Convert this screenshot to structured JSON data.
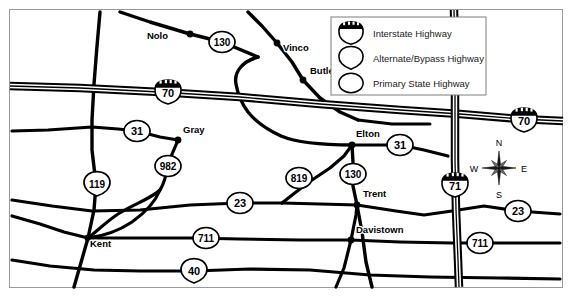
{
  "map": {
    "border_color": "#9a9a9a",
    "road_color": "#000000",
    "background": "#ffffff",
    "cities": [
      {
        "name": "Nolo",
        "label_x": 168,
        "label_y": 39,
        "dot_x": 190,
        "dot_y": 34,
        "anchor": "end"
      },
      {
        "name": "Vinco",
        "label_x": 283,
        "label_y": 51,
        "dot_x": 277,
        "dot_y": 43,
        "anchor": "start"
      },
      {
        "name": "Butler",
        "label_x": 310,
        "label_y": 74,
        "dot_x": 303,
        "dot_y": 80,
        "anchor": "start"
      },
      {
        "name": "Gray",
        "label_x": 183,
        "label_y": 133,
        "dot_x": 178,
        "dot_y": 140,
        "anchor": "start"
      },
      {
        "name": "Elton",
        "label_x": 356,
        "label_y": 137,
        "dot_x": 352,
        "dot_y": 145,
        "anchor": "start"
      },
      {
        "name": "Trent",
        "label_x": 363,
        "label_y": 197,
        "dot_x": 357,
        "dot_y": 205,
        "anchor": "start"
      },
      {
        "name": "Kent",
        "label_x": 90,
        "label_y": 247,
        "dot_x": 88,
        "dot_y": 238,
        "anchor": "start"
      },
      {
        "name": "Davistown",
        "label_x": 356,
        "label_y": 233,
        "dot_x": 351,
        "dot_y": 240,
        "anchor": "start"
      }
    ],
    "shields": [
      {
        "route": "130",
        "type": "primary-state",
        "x": 222,
        "y": 42
      },
      {
        "route": "70",
        "type": "interstate",
        "x": 168,
        "y": 92
      },
      {
        "route": "70",
        "type": "interstate",
        "x": 524,
        "y": 120
      },
      {
        "route": "31",
        "type": "primary-state",
        "x": 137,
        "y": 131
      },
      {
        "route": "31",
        "type": "primary-state",
        "x": 400,
        "y": 145
      },
      {
        "route": "982",
        "type": "primary-state",
        "x": 168,
        "y": 166
      },
      {
        "route": "119",
        "type": "alternate-bypass",
        "x": 97,
        "y": 184
      },
      {
        "route": "819",
        "type": "primary-state",
        "x": 299,
        "y": 178
      },
      {
        "route": "130",
        "type": "primary-state",
        "x": 353,
        "y": 174
      },
      {
        "route": "71",
        "type": "interstate",
        "x": 455,
        "y": 185
      },
      {
        "route": "23",
        "type": "primary-state",
        "x": 240,
        "y": 203
      },
      {
        "route": "23",
        "type": "primary-state",
        "x": 518,
        "y": 211
      },
      {
        "route": "711",
        "type": "primary-state",
        "x": 206,
        "y": 238
      },
      {
        "route": "711",
        "type": "primary-state",
        "x": 480,
        "y": 243
      },
      {
        "route": "40",
        "type": "alternate-bypass",
        "x": 194,
        "y": 271
      }
    ],
    "compass": {
      "center_x": 499,
      "center_y": 168,
      "north": "N",
      "east": "E",
      "south": "S",
      "west": "W"
    }
  },
  "legend": {
    "x": 331,
    "y": 17,
    "width": 155,
    "height": 78,
    "items": [
      {
        "label": "Interstate Highway",
        "type": "interstate"
      },
      {
        "label": "Alternate/Bypass Highway",
        "type": "alternate-bypass"
      },
      {
        "label": "Primary State Highway",
        "type": "primary-state"
      }
    ]
  }
}
